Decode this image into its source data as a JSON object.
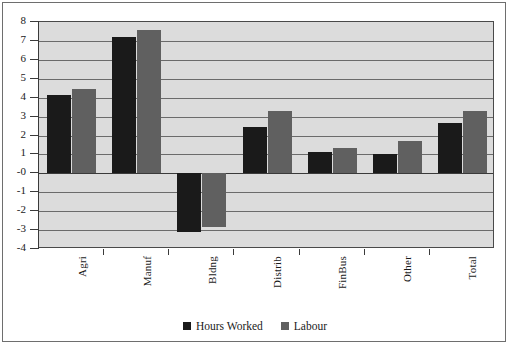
{
  "chart_data": {
    "type": "bar",
    "title": "",
    "subtitle": "",
    "xlabel": "",
    "ylabel": "",
    "categories": [
      "Agri",
      "Manuf",
      "Bldng",
      "Distrib",
      "FinBus",
      "Other",
      "Total"
    ],
    "series": [
      {
        "name": "Hours Worked",
        "color": "#1a1a1a",
        "values": [
          4.15,
          7.2,
          -3.1,
          2.45,
          1.15,
          1.0,
          2.65
        ]
      },
      {
        "name": "Labour",
        "color": "#606060",
        "values": [
          4.45,
          7.6,
          -2.85,
          3.3,
          1.35,
          1.7,
          3.3
        ]
      }
    ],
    "ylim": [
      -4,
      8
    ],
    "yticks": [
      8,
      7,
      6,
      5,
      4,
      3,
      2,
      1,
      0,
      -1,
      -2,
      -3,
      -4
    ],
    "ytick_labels": [
      "8",
      "7",
      "6",
      "5",
      "4",
      "3",
      "2",
      "1",
      "-0",
      "-1",
      "-2",
      "-3",
      "-4"
    ],
    "grid": true,
    "grid_axis": "y",
    "legend_position": "bottom",
    "legend": [
      "Hours Worked",
      "Labour"
    ],
    "plot_background": "#dcdcdc",
    "figure_background": "#ffffff"
  }
}
